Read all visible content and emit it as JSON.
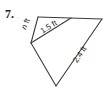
{
  "problem_number": "7.",
  "figure": {
    "canvas": {
      "width": 106,
      "height": 90
    },
    "colors": {
      "line": "#3b3b3b",
      "text": "#262626",
      "background": "#ffffff"
    },
    "line_width": 1.1,
    "vertices": {
      "A": [
        38,
        17
      ],
      "B": [
        102,
        19
      ],
      "L": [
        31,
        43
      ],
      "C": [
        56,
        86
      ],
      "E": [
        71,
        18
      ]
    },
    "edges": [
      {
        "name": "top-edge",
        "from": "A",
        "to": "B"
      },
      {
        "name": "upper-left-edge",
        "from": "A",
        "to": "L"
      },
      {
        "name": "lower-left-edge",
        "from": "L",
        "to": "C"
      },
      {
        "name": "right-edge",
        "from": "C",
        "to": "B"
      },
      {
        "name": "inner-segment",
        "from": "L",
        "to": "E"
      }
    ],
    "labels": [
      {
        "name": "label-n-ft",
        "text": "n ft",
        "italic_part": "n",
        "rest": " ft",
        "x": 28,
        "y": 25,
        "angle": -66,
        "font_size": 8
      },
      {
        "name": "label-1-5-ft",
        "text": "1.5 ft",
        "italic_part": "",
        "rest": "1.5 ft",
        "x": 50,
        "y": 29,
        "angle": -32,
        "font_size": 8
      },
      {
        "name": "label-2-4-ft",
        "text": "2.4 ft",
        "italic_part": "",
        "rest": "2.4 ft",
        "x": 82,
        "y": 56,
        "angle": -56,
        "font_size": 8
      }
    ]
  }
}
